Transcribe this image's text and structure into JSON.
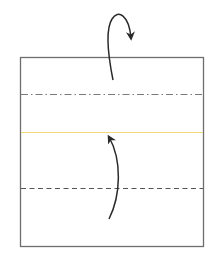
{
  "diagram": {
    "type": "origami-fold-instruction",
    "paper": {
      "x": 20,
      "y": 57,
      "width": 183,
      "height": 189,
      "stroke": "#6e6e6e",
      "fill": "#ffffff"
    },
    "lines": [
      {
        "name": "mountain-fold-line",
        "style": "dash-dot",
        "y": 94,
        "color": "#7a7a7a"
      },
      {
        "name": "crease-line",
        "style": "solid",
        "y": 132,
        "color": "#f2d77a"
      },
      {
        "name": "valley-fold-line",
        "style": "dashed",
        "y": 188,
        "color": "#555555"
      }
    ],
    "arrows": [
      {
        "name": "fold-behind-arrow",
        "direction": "up-over-and-back",
        "color": "#2a2a2a"
      },
      {
        "name": "fold-up-arrow",
        "direction": "up",
        "color": "#2a2a2a"
      }
    ]
  }
}
